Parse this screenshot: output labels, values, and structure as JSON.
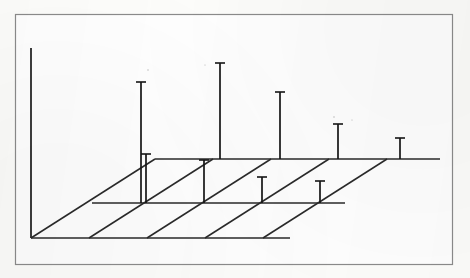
{
  "figure": {
    "kind": "scanned-figure",
    "frame": {
      "x": 15,
      "y": 14,
      "width": 438,
      "height": 251,
      "border_color": "#8b8b8b",
      "fill_color": "#ffffff"
    },
    "background_color": "#fdfdfb",
    "ink_color": "#161616",
    "title": "",
    "caption": "",
    "axis_labels": {
      "x": "",
      "y": "",
      "z": ""
    },
    "tick_labels": [],
    "legend": []
  },
  "geometry": {
    "origin": {
      "x": 31,
      "y": 238
    },
    "z_axis_top": {
      "x": 31,
      "y": 48
    },
    "row_y": {
      "front": 238,
      "middle": 203,
      "back": 159
    },
    "row_x_start": {
      "front": 31,
      "middle": 92,
      "back": 155
    },
    "row_x_end": {
      "front": 290,
      "middle": 345,
      "back": 440
    },
    "column_spacing_front": 58,
    "depth_offset": {
      "dx": 62,
      "dy": -39
    },
    "columns_front_x": [
      89,
      147,
      205,
      263
    ],
    "columns_middle_x": [
      146,
      204,
      262,
      320
    ],
    "columns_back_x": [
      141,
      220,
      280,
      338,
      400
    ],
    "stem_cap_half_width": 5
  },
  "chart_data": {
    "type": "scatter",
    "subtype": "3d-stem-plot",
    "title": "",
    "xlabel": "",
    "ylabel": "",
    "zlabel": "",
    "grid": true,
    "legend_position": "none",
    "axis_ranges": {
      "x": [
        0,
        5
      ],
      "y": [
        0,
        3
      ],
      "z": [
        0,
        1
      ]
    },
    "baseline_rows": [
      {
        "name": "front",
        "depth_index": 0,
        "baseline_y_px": 238,
        "x_from_px": 31,
        "x_to_px": 290
      },
      {
        "name": "middle",
        "depth_index": 1,
        "baseline_y_px": 203,
        "x_from_px": 92,
        "x_to_px": 345
      },
      {
        "name": "back",
        "depth_index": 2,
        "baseline_y_px": 159,
        "x_from_px": 155,
        "x_to_px": 440
      }
    ],
    "depth_lines": [
      {
        "from_x": 31,
        "from_y": 238,
        "to_x": 155,
        "to_y": 159
      },
      {
        "from_x": 89,
        "from_y": 238,
        "to_x": 213,
        "to_y": 159
      },
      {
        "from_x": 147,
        "from_y": 238,
        "to_x": 271,
        "to_y": 159
      },
      {
        "from_x": 205,
        "from_y": 238,
        "to_x": 329,
        "to_y": 159
      },
      {
        "from_x": 263,
        "from_y": 238,
        "to_x": 387,
        "to_y": 159
      }
    ],
    "stems": [
      {
        "id": "s1",
        "row": "back",
        "x_px": 141,
        "base_y_px": 203,
        "top_y_px": 82,
        "height_px": 121,
        "value": 0.64
      },
      {
        "id": "s2",
        "row": "back",
        "x_px": 220,
        "base_y_px": 159,
        "top_y_px": 63,
        "height_px": 96,
        "value": 0.51
      },
      {
        "id": "s3",
        "row": "back",
        "x_px": 280,
        "base_y_px": 159,
        "top_y_px": 92,
        "height_px": 67,
        "value": 0.35
      },
      {
        "id": "s4",
        "row": "back",
        "x_px": 338,
        "base_y_px": 159,
        "top_y_px": 124,
        "height_px": 35,
        "value": 0.18
      },
      {
        "id": "s5",
        "row": "back",
        "x_px": 400,
        "base_y_px": 159,
        "top_y_px": 138,
        "height_px": 21,
        "value": 0.11
      },
      {
        "id": "s6",
        "row": "middle",
        "x_px": 204,
        "base_y_px": 203,
        "top_y_px": 160,
        "height_px": 43,
        "value": 0.23
      },
      {
        "id": "s7",
        "row": "middle",
        "x_px": 262,
        "base_y_px": 203,
        "top_y_px": 177,
        "height_px": 26,
        "value": 0.14
      },
      {
        "id": "s8",
        "row": "middle",
        "x_px": 320,
        "base_y_px": 203,
        "top_y_px": 181,
        "height_px": 22,
        "value": 0.12
      },
      {
        "id": "s9",
        "row": "middle",
        "x_px": 146,
        "base_y_px": 203,
        "top_y_px": 154,
        "height_px": 49,
        "value": 0.26
      }
    ],
    "series": [
      {
        "name": "back-row",
        "categories": [
          "1",
          "2",
          "3",
          "4",
          "5"
        ],
        "values": [
          0.64,
          0.51,
          0.35,
          0.18,
          0.11
        ]
      },
      {
        "name": "middle-row",
        "categories": [
          "1",
          "2",
          "3",
          "4"
        ],
        "values": [
          0.26,
          0.23,
          0.14,
          0.12
        ]
      },
      {
        "name": "front-row",
        "categories": [
          "1",
          "2",
          "3",
          "4"
        ],
        "values": [
          0,
          0,
          0,
          0
        ]
      }
    ]
  }
}
